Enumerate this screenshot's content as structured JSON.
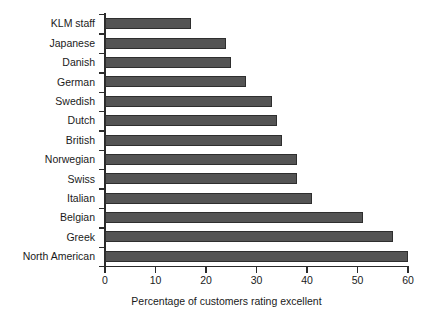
{
  "chart_data": {
    "type": "bar",
    "orientation": "horizontal",
    "title": "",
    "xlabel": "Percentage of customers rating excellent",
    "ylabel": "",
    "xlim": [
      0,
      60
    ],
    "xticks": [
      0,
      10,
      20,
      30,
      40,
      50,
      60
    ],
    "xtick_labels": [
      "0",
      "10",
      "20",
      "30",
      "40",
      "50",
      "60"
    ],
    "grid": false,
    "legend": false,
    "categories": [
      "KLM staff",
      "Japanese",
      "Danish",
      "German",
      "Swedish",
      "Dutch",
      "British",
      "Norwegian",
      "Swiss",
      "Italian",
      "Belgian",
      "Greek",
      "North American"
    ],
    "values": [
      17,
      24,
      25,
      28,
      33,
      34,
      35,
      38,
      38,
      41,
      51,
      57,
      60
    ],
    "bar_color": "#545454",
    "bar_edge_color": "#2e2e2e",
    "axis_color": "#2b2b2b",
    "background_color": "#ffffff"
  }
}
